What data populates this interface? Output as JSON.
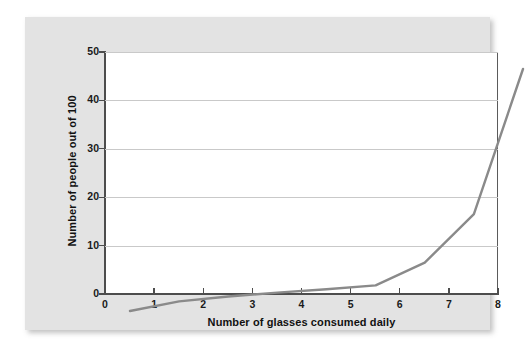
{
  "chart_data": {
    "type": "line",
    "title": "",
    "subtitle": "",
    "xlabel": "Number of glasses consumed daily",
    "ylabel": "Number of people out of 100",
    "x": [
      0,
      1,
      2,
      3,
      4,
      5,
      6,
      7,
      8
    ],
    "values": [
      0,
      2,
      3,
      3.8,
      4.5,
      5.3,
      10,
      20,
      50
    ],
    "series": [
      {
        "name": "People out of 100",
        "x": [
          0,
          1,
          2,
          3,
          4,
          5,
          6,
          7,
          8
        ],
        "values": [
          0,
          2,
          3,
          3.8,
          4.5,
          5.3,
          10,
          20,
          50
        ]
      }
    ],
    "xlim": [
      0,
      8
    ],
    "ylim": [
      0,
      50
    ],
    "xticks": [
      "0",
      "1",
      "2",
      "3",
      "4",
      "5",
      "6",
      "7",
      "8"
    ],
    "yticks": [
      "0",
      "10",
      "20",
      "30",
      "40",
      "50"
    ],
    "grid": "horizontal",
    "legend": "none",
    "line_color": "#8a8a8a",
    "grid_color": "#c9c9c9",
    "axis_color": "#4d4d4d",
    "plot_background": "#ffffff",
    "card_background": "#e3e3e3",
    "annotations": []
  },
  "axes": {
    "y_title": "Number of people out of 100",
    "x_title": "Number of glasses consumed daily",
    "y_ticks": [
      {
        "label": "50",
        "value": 50
      },
      {
        "label": "40",
        "value": 40
      },
      {
        "label": "30",
        "value": 30
      },
      {
        "label": "20",
        "value": 20
      },
      {
        "label": "10",
        "value": 10
      },
      {
        "label": "0",
        "value": 0
      }
    ],
    "x_ticks": [
      {
        "label": "0",
        "value": 0
      },
      {
        "label": "1",
        "value": 1
      },
      {
        "label": "2",
        "value": 2
      },
      {
        "label": "3",
        "value": 3
      },
      {
        "label": "4",
        "value": 4
      },
      {
        "label": "5",
        "value": 5
      },
      {
        "label": "6",
        "value": 6
      },
      {
        "label": "7",
        "value": 7
      },
      {
        "label": "8",
        "value": 8
      }
    ]
  }
}
